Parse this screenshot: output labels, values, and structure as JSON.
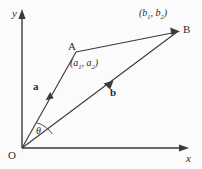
{
  "figure": {
    "background_color": "#fbfbfb",
    "stroke_color": "#3a3a3a",
    "text_color": "#2b2b2b"
  },
  "axes": {
    "y_label": "y",
    "x_label": "x",
    "origin_label": "O"
  },
  "points": {
    "A": {
      "label": "A",
      "coord_open": "(",
      "coord_a1": "a",
      "coord_sub1": "1",
      "coord_comma": ", ",
      "coord_a2": "a",
      "coord_sub2": "2",
      "coord_close": ")",
      "x": 76,
      "y": 52
    },
    "B": {
      "label": "B",
      "coord_open": "(",
      "coord_b1": "b",
      "coord_sub1": "1",
      "coord_comma": ", ",
      "coord_b2": "b",
      "coord_sub2": "2",
      "coord_close": ")",
      "x": 177,
      "y": 32
    },
    "O": {
      "label": "O",
      "x": 22,
      "y": 148
    }
  },
  "vectors": {
    "a": {
      "label": "a",
      "from": "O",
      "to": "A"
    },
    "b": {
      "label": "b",
      "from": "O",
      "to": "B"
    },
    "ab": {
      "from": "A",
      "to": "B"
    }
  },
  "angle": {
    "label": "θ",
    "between": [
      "a",
      "b"
    ]
  }
}
